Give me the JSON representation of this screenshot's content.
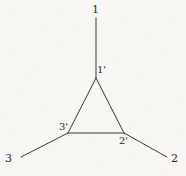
{
  "figure": {
    "background_color": "#f7f6f3",
    "line_color": "#3a3a3a",
    "label_color": "#2b2b2b",
    "line_width": 1,
    "width": 186,
    "height": 176,
    "labels": {
      "outer_top": "1",
      "outer_bottom_right": "2",
      "outer_bottom_left": "3",
      "inner_top": "1'",
      "inner_bottom_right": "2'",
      "inner_bottom_left": "3'"
    },
    "label_positions": {
      "outer_top": {
        "x": 92,
        "y": 4
      },
      "outer_bottom_right": {
        "x": 171,
        "y": 153
      },
      "outer_bottom_left": {
        "x": 5,
        "y": 153
      },
      "inner_top": {
        "x": 97,
        "y": 64
      },
      "inner_bottom_right": {
        "x": 119,
        "y": 135
      },
      "inner_bottom_left": {
        "x": 59,
        "y": 121
      }
    },
    "vertices": {
      "inner_top": {
        "x": 96,
        "y": 78
      },
      "inner_bottom_right": {
        "x": 124,
        "y": 133
      },
      "inner_bottom_left": {
        "x": 68,
        "y": 133
      },
      "outer_top": {
        "x": 96,
        "y": 18
      },
      "outer_bottom_right": {
        "x": 167,
        "y": 157
      },
      "outer_bottom_left": {
        "x": 21,
        "y": 157
      }
    },
    "segments": [
      {
        "name": "triangle-edge-left",
        "from": "inner_top",
        "to": "inner_bottom_left"
      },
      {
        "name": "triangle-edge-right",
        "from": "inner_top",
        "to": "inner_bottom_right"
      },
      {
        "name": "triangle-edge-base",
        "from": "inner_bottom_left",
        "to": "inner_bottom_right"
      },
      {
        "name": "leg-top",
        "from": "inner_top",
        "to": "outer_top"
      },
      {
        "name": "leg-bottom-right",
        "from": "inner_bottom_right",
        "to": "outer_bottom_right"
      },
      {
        "name": "leg-bottom-left",
        "from": "inner_bottom_left",
        "to": "outer_bottom_left"
      }
    ]
  }
}
